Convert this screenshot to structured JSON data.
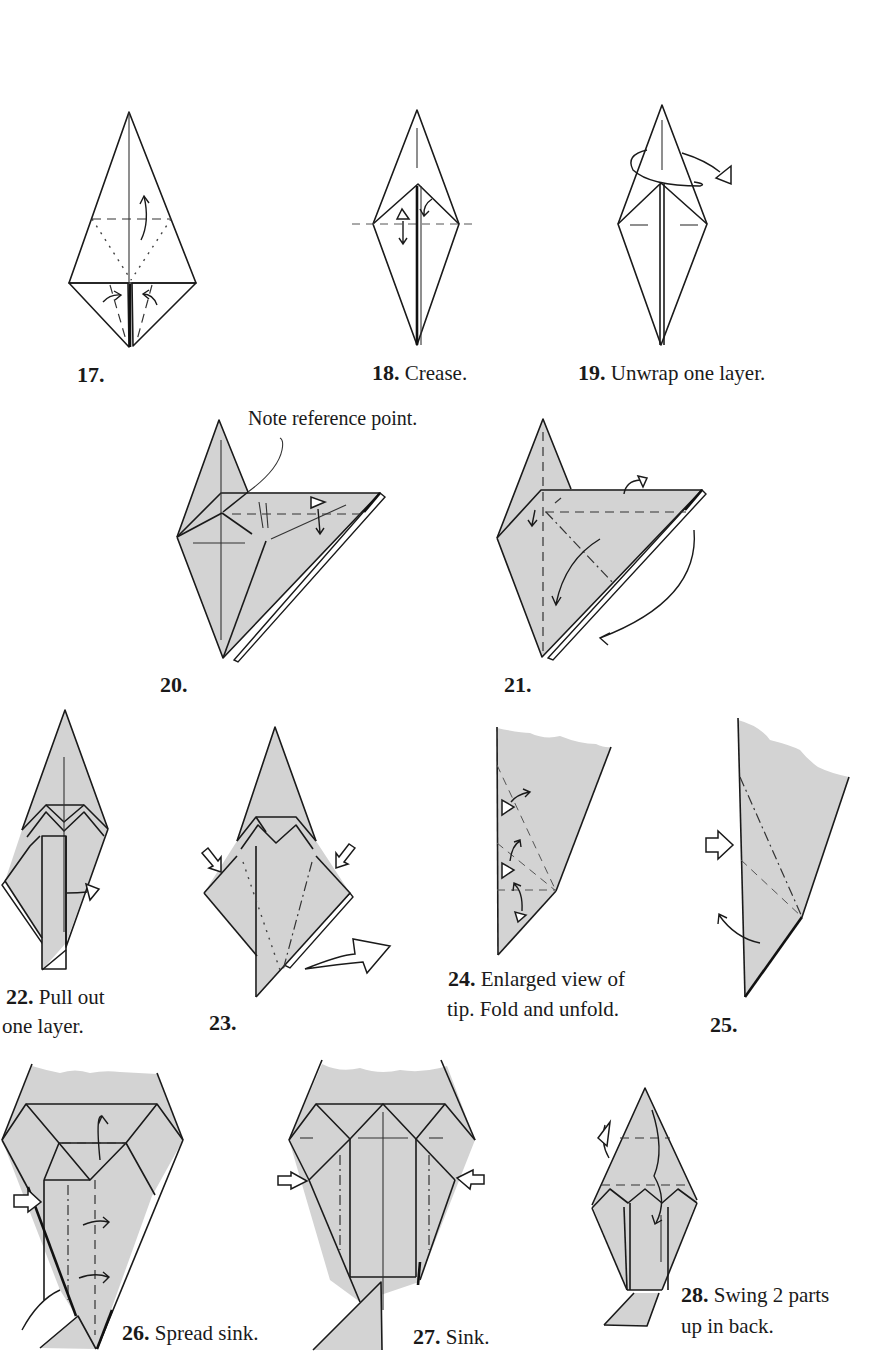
{
  "page": {
    "type": "origami-instruction-page",
    "paper_color": "#d3d3d3",
    "ink_color": "#1a1a1a",
    "background": "#ffffff"
  },
  "steps": [
    {
      "number": "17.",
      "text": ""
    },
    {
      "number": "18.",
      "text": "Crease."
    },
    {
      "number": "19.",
      "text": "Unwrap one layer."
    },
    {
      "number": "20.",
      "text": "",
      "note": "Note reference point."
    },
    {
      "number": "21.",
      "text": ""
    },
    {
      "number": "22.",
      "text": "Pull out",
      "text2": "one layer."
    },
    {
      "number": "23.",
      "text": ""
    },
    {
      "number": "24.",
      "text": "Enlarged view of",
      "text2": "tip. Fold and unfold."
    },
    {
      "number": "25.",
      "text": ""
    },
    {
      "number": "26.",
      "text": "Spread sink."
    },
    {
      "number": "27.",
      "text": "Sink."
    },
    {
      "number": "28.",
      "text": "Swing 2 parts",
      "text2": "up in back."
    }
  ],
  "legend_icons": {
    "valley_fold": "dashed-line",
    "mountain_fold": "dot-dash-line",
    "fold_arrow": "curved-arrow-icon",
    "unfold_arrow": "hollow-triangle-arrow-icon",
    "push_arrow": "hollow-push-arrow-icon"
  }
}
